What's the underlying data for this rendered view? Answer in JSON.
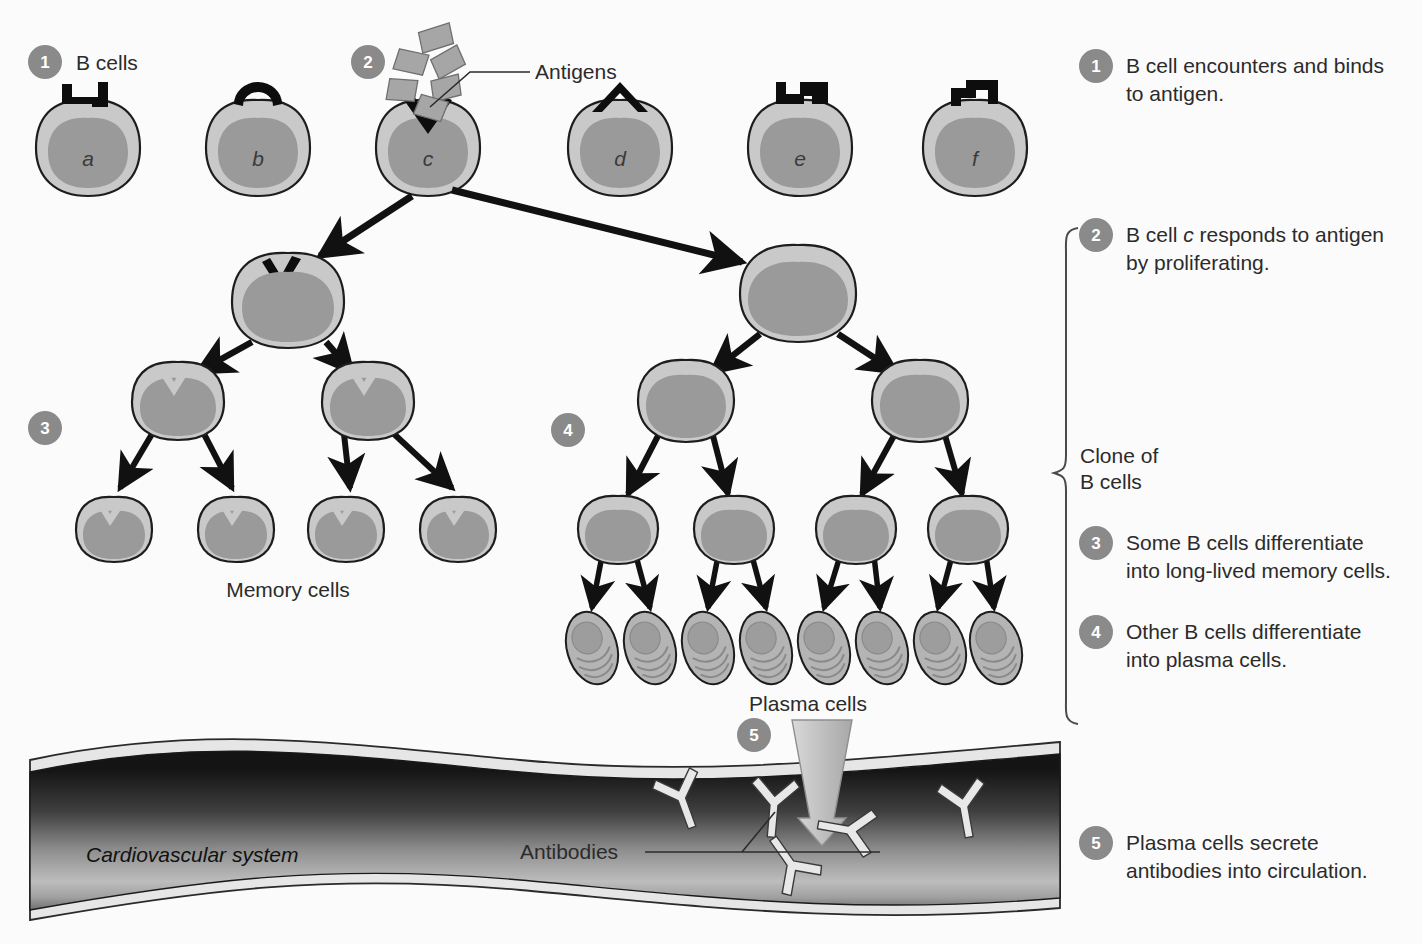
{
  "diagram": {
    "background_color": "#fbfbfb",
    "badge_color": "#8a8a8a",
    "cell_membrane_color": "#c9c9c9",
    "nucleus_color": "#9a9a9a",
    "vessel_dark_color": "#1b1b1b",
    "vessel_light_color": "#b9b9b9"
  },
  "steps": [
    {
      "num": "1",
      "text_line1": "B cell encounters and binds",
      "text_line2": "to antigen."
    },
    {
      "num": "2",
      "text_line1": "B cell c responds to antigen",
      "text_line2": "by proliferating.",
      "italic_token": "c"
    },
    {
      "num": "3",
      "text_line1": "Some B cells differentiate",
      "text_line2": "into long-lived memory cells."
    },
    {
      "num": "4",
      "text_line1": "Other B cells differentiate",
      "text_line2": "into plasma cells."
    },
    {
      "num": "5",
      "text_line1": "Plasma cells secrete",
      "text_line2": "antibodies into circulation."
    }
  ],
  "inline_badges": [
    {
      "num": "1",
      "x": 45,
      "y": 62
    },
    {
      "num": "2",
      "x": 368,
      "y": 62
    },
    {
      "num": "3",
      "x": 45,
      "y": 428
    },
    {
      "num": "4",
      "x": 568,
      "y": 430
    },
    {
      "num": "5",
      "x": 754,
      "y": 735
    }
  ],
  "labels": {
    "b_cells": "B cells",
    "antigens": "Antigens",
    "memory_cells": "Memory cells",
    "plasma_cells": "Plasma cells",
    "antibodies": "Antibodies",
    "cardiovascular_system": "Cardiovascular system",
    "clone_of_line1": "Clone of",
    "clone_of_line2": "B cells"
  },
  "b_cells": [
    {
      "letter": "a",
      "cx": 88,
      "cy": 145,
      "receptor": "square-notch"
    },
    {
      "letter": "b",
      "cx": 258,
      "cy": 145,
      "receptor": "round-notch"
    },
    {
      "letter": "c",
      "cx": 428,
      "cy": 145,
      "receptor": "v-notch"
    },
    {
      "letter": "d",
      "cx": 620,
      "cy": 145,
      "receptor": "triangle-notch"
    },
    {
      "letter": "e",
      "cx": 800,
      "cy": 145,
      "receptor": "step-notch"
    },
    {
      "letter": "f",
      "cx": 975,
      "cy": 145,
      "receptor": "zigzag-notch"
    }
  ],
  "antigens": [
    {
      "x": 432,
      "y": 40,
      "r": -12
    },
    {
      "x": 412,
      "y": 62,
      "r": 14
    },
    {
      "x": 447,
      "y": 63,
      "r": -20
    },
    {
      "x": 404,
      "y": 88,
      "r": 8
    },
    {
      "x": 444,
      "y": 87,
      "r": -6
    },
    {
      "x": 432,
      "y": 107,
      "r": 18
    }
  ],
  "memory_branch": {
    "parent": {
      "cx": 288,
      "cy": 300
    },
    "mid": [
      {
        "cx": 178,
        "cy": 402
      },
      {
        "cx": 368,
        "cy": 402
      }
    ],
    "leaves": [
      {
        "cx": 114,
        "cy": 527
      },
      {
        "cx": 236,
        "cy": 527
      },
      {
        "cx": 346,
        "cy": 527
      },
      {
        "cx": 458,
        "cy": 527
      }
    ]
  },
  "plasma_branch": {
    "parent": {
      "cx": 798,
      "cy": 292
    },
    "mid": [
      {
        "cx": 686,
        "cy": 400
      },
      {
        "cx": 920,
        "cy": 400
      }
    ],
    "third": [
      {
        "cx": 618,
        "cy": 527
      },
      {
        "cx": 734,
        "cy": 527
      },
      {
        "cx": 856,
        "cy": 527
      },
      {
        "cx": 968,
        "cy": 527
      }
    ],
    "plasma_cells": [
      {
        "cx": 592,
        "cy": 645
      },
      {
        "cx": 648,
        "cy": 645
      },
      {
        "cx": 708,
        "cy": 645
      },
      {
        "cx": 764,
        "cy": 645
      },
      {
        "cx": 822,
        "cy": 645
      },
      {
        "cx": 878,
        "cy": 645
      },
      {
        "cx": 936,
        "cy": 645
      },
      {
        "cx": 992,
        "cy": 645
      }
    ]
  },
  "antibodies": [
    {
      "x": 680,
      "y": 800,
      "r": -20
    },
    {
      "x": 772,
      "y": 805,
      "r": 5
    },
    {
      "x": 840,
      "y": 830,
      "r": 100
    },
    {
      "x": 790,
      "y": 862,
      "r": 145
    },
    {
      "x": 960,
      "y": 810,
      "r": -10
    }
  ],
  "vessel": {
    "top_y": 748,
    "bottom_y": 912,
    "left_x": 30,
    "right_x": 1060
  }
}
